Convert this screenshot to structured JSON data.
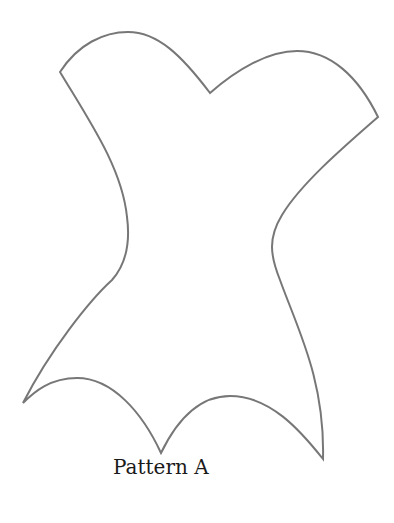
{
  "diagram": {
    "type": "sewing-pattern",
    "shape": "corset-bodice-outline",
    "label": "Pattern A",
    "stroke_color": "#777777",
    "background_color": "#ffffff"
  }
}
